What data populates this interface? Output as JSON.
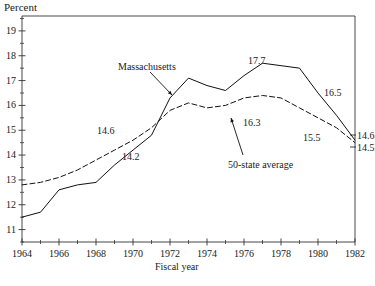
{
  "chart_data": {
    "type": "line",
    "title": "",
    "xlabel": "Fiscal year",
    "ylabel": "Percent",
    "xlim": [
      1964,
      1982
    ],
    "ylim": [
      10.5,
      19.6
    ],
    "grid": false,
    "legend": "inline-annotations",
    "x": [
      1964,
      1965,
      1966,
      1967,
      1968,
      1969,
      1970,
      1971,
      1972,
      1973,
      1974,
      1975,
      1976,
      1977,
      1978,
      1979,
      1980,
      1981,
      1982
    ],
    "series": [
      {
        "name": "Massachusetts",
        "style": "solid",
        "values": [
          11.5,
          11.7,
          12.6,
          12.8,
          12.9,
          13.6,
          14.2,
          14.8,
          16.3,
          17.1,
          16.8,
          16.6,
          17.2,
          17.7,
          17.6,
          17.5,
          16.5,
          15.6,
          14.6
        ]
      },
      {
        "name": "50-state average",
        "style": "dashed",
        "values": [
          12.8,
          12.9,
          13.1,
          13.4,
          13.8,
          14.2,
          14.6,
          15.1,
          15.8,
          16.1,
          15.9,
          16.0,
          16.3,
          16.4,
          16.3,
          15.9,
          15.5,
          15.1,
          14.5
        ]
      }
    ],
    "y_major_ticks": [
      11,
      12,
      13,
      14,
      15,
      16,
      17,
      18,
      19
    ],
    "y_minor_ticks": [
      10.5,
      11.5,
      12.5,
      13.5,
      14.5,
      15.5,
      16.5,
      17.5,
      18.5,
      19.5
    ],
    "x_major_ticks": [
      1964,
      1966,
      1968,
      1970,
      1972,
      1974,
      1976,
      1978,
      1980,
      1982
    ],
    "x_minor_ticks": [
      1965,
      1967,
      1969,
      1971,
      1973,
      1975,
      1977,
      1979,
      1981
    ],
    "annotations": [
      {
        "text": "Massachusetts",
        "x_px": 118,
        "y_px": 62,
        "kind": "series-label",
        "arrow": {
          "x1": 150,
          "y1": 72,
          "x2": 172,
          "y2": 95
        }
      },
      {
        "text": "50-state average",
        "x_px": 228,
        "y_px": 160,
        "kind": "series-label",
        "arrow": {
          "x1": 243,
          "y1": 155,
          "x2": 231,
          "y2": 118
        }
      },
      {
        "text": "14.6",
        "x_px": 97,
        "y_px": 126,
        "kind": "value"
      },
      {
        "text": "14.2",
        "x_px": 122,
        "y_px": 152,
        "kind": "value"
      },
      {
        "text": "17.7",
        "x_px": 248,
        "y_px": 56,
        "kind": "value"
      },
      {
        "text": "16.3",
        "x_px": 243,
        "y_px": 118,
        "kind": "value"
      },
      {
        "text": "15.5",
        "x_px": 303,
        "y_px": 133,
        "kind": "value"
      },
      {
        "text": "16.5",
        "x_px": 324,
        "y_px": 88,
        "kind": "value"
      },
      {
        "text": "14.6",
        "x_px": 357,
        "y_px": 131,
        "kind": "value"
      },
      {
        "text": "14.5",
        "x_px": 357,
        "y_px": 143,
        "kind": "value"
      }
    ]
  },
  "axes": {
    "y_title": "Percent",
    "x_title": "Fiscal year",
    "y_tick_labels": [
      "19",
      "18",
      "17",
      "16",
      "15",
      "14",
      "13",
      "12",
      "11"
    ],
    "x_tick_labels": [
      "1964",
      "1966",
      "1968",
      "1970",
      "1972",
      "1974",
      "1976",
      "1978",
      "1980",
      "1982"
    ]
  },
  "colors": {
    "line": "#111111",
    "axis": "#333333",
    "text": "#1a1a1a",
    "background": "#ffffff"
  }
}
